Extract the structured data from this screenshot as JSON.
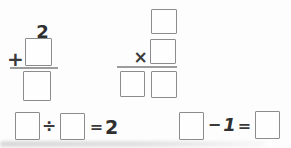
{
  "sheet": {
    "background_color": "#fdfdfd",
    "box_border_color": "#8c8c8c",
    "rule_color": "#9c9c9c",
    "ink_color": "#3a3a3a"
  },
  "problems": {
    "addition": {
      "given_addend": "2",
      "operator": "+",
      "addend_box_value": "",
      "sum_box_value": ""
    },
    "multiplication": {
      "operator": "×",
      "multiplicand_box_value": "",
      "multiplier_box_value": "",
      "product_tens_box_value": "",
      "product_ones_box_value": ""
    },
    "division": {
      "dividend_box_value": "",
      "operator": "÷",
      "divisor_box_value": "",
      "equals_sign": "=",
      "quotient": "2"
    },
    "subtraction": {
      "minuend_box_value": "",
      "operator": "−",
      "subtrahend": "1",
      "equals_sign": "=",
      "difference_box_value": ""
    }
  }
}
